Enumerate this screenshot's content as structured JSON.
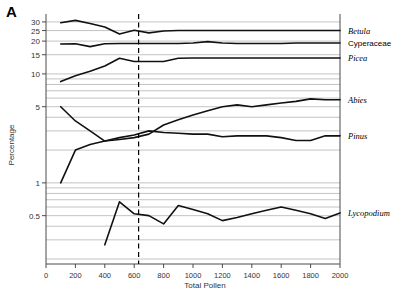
{
  "panel": {
    "label": "A"
  },
  "axes": {
    "y_title": "Percentage",
    "x_title": "Total Pollen",
    "y_scale": "log",
    "y_tick_labels": [
      "30",
      "25",
      "20",
      "15",
      "10",
      "5",
      "1",
      "0.5"
    ],
    "y_tick_values": [
      30,
      25,
      20,
      15,
      10,
      5,
      1,
      0.5
    ],
    "y_minor_gridlines": [
      30,
      25,
      20,
      15,
      10,
      9,
      8,
      7,
      6,
      5,
      4,
      3,
      2,
      1,
      0.9,
      0.8,
      0.7,
      0.6,
      0.5,
      0.4,
      0.3,
      0.2
    ],
    "x_tick_labels": [
      "0",
      "200",
      "400",
      "600",
      "800",
      "1000",
      "1200",
      "1400",
      "1600",
      "1800",
      "2000"
    ],
    "x_tick_values": [
      0,
      200,
      400,
      600,
      800,
      1000,
      1200,
      1400,
      1600,
      1800,
      2000
    ],
    "xlim": [
      0,
      2000
    ],
    "ylim": [
      0.18,
      34
    ]
  },
  "annotations": {
    "reference_line": {
      "x": 630,
      "style": "dashed",
      "color": "#000000"
    }
  },
  "chart_data": {
    "type": "line",
    "title": "",
    "subtitle": "",
    "xlabel": "Total Pollen",
    "ylabel": "Percentage",
    "yscale": "log",
    "xlim": [
      0,
      2000
    ],
    "ylim": [
      0.18,
      34
    ],
    "grid": true,
    "legend_position": "right-inline-labels",
    "x": [
      100,
      200,
      300,
      400,
      500,
      600,
      700,
      800,
      900,
      1000,
      1100,
      1200,
      1300,
      1400,
      1500,
      1600,
      1700,
      1800,
      1900,
      2000
    ],
    "series": [
      {
        "name": "Betula",
        "label_style": "italic",
        "values": [
          29.5,
          31.0,
          29.0,
          27.0,
          23.2,
          25.2,
          23.8,
          24.8,
          25.0,
          25.0,
          25.0,
          25.0,
          25.0,
          25.0,
          25.0,
          25.0,
          25.0,
          25.0,
          25.0,
          25.0
        ]
      },
      {
        "name": "Cyperaceae",
        "label_style": "upright",
        "values": [
          18.8,
          18.9,
          17.8,
          18.9,
          19.0,
          19.0,
          19.0,
          19.0,
          19.0,
          19.2,
          19.8,
          19.2,
          19.0,
          19.0,
          19.0,
          19.0,
          19.2,
          19.2,
          19.2,
          19.2
        ]
      },
      {
        "name": "Picea",
        "label_style": "italic",
        "values": [
          8.5,
          9.6,
          10.6,
          11.8,
          13.9,
          13.0,
          13.0,
          13.0,
          13.9,
          14.0,
          14.0,
          14.0,
          14.0,
          14.0,
          14.0,
          14.0,
          14.0,
          14.0,
          14.0,
          14.0
        ]
      },
      {
        "name": "Abies",
        "label_style": "italic",
        "values": [
          1.0,
          2.0,
          2.25,
          2.42,
          2.5,
          2.6,
          2.8,
          3.4,
          3.8,
          4.2,
          4.6,
          5.0,
          5.2,
          5.0,
          5.2,
          5.4,
          5.6,
          5.9,
          5.8,
          5.8
        ]
      },
      {
        "name": "Pinus",
        "label_style": "italic",
        "values": [
          5.0,
          3.7,
          3.0,
          2.42,
          2.6,
          2.75,
          3.0,
          2.9,
          2.85,
          2.8,
          2.8,
          2.65,
          2.7,
          2.7,
          2.7,
          2.6,
          2.45,
          2.45,
          2.7,
          2.7
        ]
      },
      {
        "name": "Lycopodium",
        "label_style": "italic",
        "x_start_index": 3,
        "values": [
          null,
          null,
          null,
          0.27,
          0.67,
          0.52,
          0.5,
          0.42,
          0.62,
          0.57,
          0.52,
          0.45,
          0.48,
          0.52,
          0.56,
          0.6,
          0.56,
          0.52,
          0.47,
          0.53
        ]
      }
    ]
  },
  "series_labels": [
    {
      "text": "Betula",
      "style": "italic"
    },
    {
      "text": "Cyperaceae",
      "style": "upright"
    },
    {
      "text": "Picea",
      "style": "italic"
    },
    {
      "text": "Abies",
      "style": "italic"
    },
    {
      "text": "Pinus",
      "style": "italic"
    },
    {
      "text": "Lycopodium",
      "style": "italic"
    }
  ]
}
